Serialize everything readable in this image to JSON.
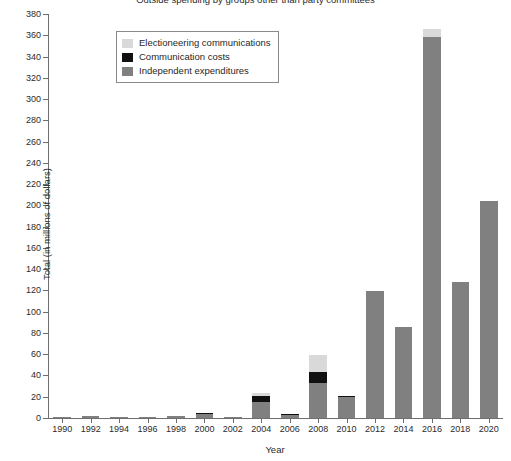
{
  "chart_data": {
    "type": "bar",
    "title": "Outside spending by groups other than party committees",
    "xlabel": "Year",
    "ylabel": "Total (in millions of dollars)",
    "ylim": [
      0,
      380
    ],
    "ytick_step": 20,
    "grid": false,
    "stacked": true,
    "legend_position": "top-left-inside",
    "categories": [
      "1990",
      "1992",
      "1994",
      "1996",
      "1998",
      "2000",
      "2002",
      "2004",
      "2006",
      "2008",
      "2010",
      "2012",
      "2014",
      "2016",
      "2018",
      "2020"
    ],
    "series": [
      {
        "name": "Independent expenditures",
        "color": "#808080",
        "values": [
          0.5,
          2,
          1,
          1,
          2,
          3.5,
          1,
          15,
          2.5,
          33,
          19.5,
          119,
          86,
          358,
          128,
          204
        ]
      },
      {
        "name": "Communication costs",
        "color": "#111111",
        "values": [
          0,
          0,
          0,
          0,
          0,
          0.5,
          0,
          6,
          0.5,
          10,
          0.5,
          0,
          0,
          0,
          0,
          0
        ]
      },
      {
        "name": "Electioneering communications",
        "color": "#d9d9d9",
        "values": [
          0,
          0,
          0,
          0,
          0,
          0,
          0,
          3,
          0,
          16,
          0,
          0,
          0,
          8,
          0,
          0
        ]
      }
    ],
    "totals": [
      0.5,
      2,
      1,
      1,
      2,
      4,
      1,
      24,
      3,
      59,
      20,
      119,
      86,
      366,
      128,
      204
    ],
    "yticks": [
      "0",
      "20",
      "40",
      "60",
      "80",
      "100",
      "120",
      "140",
      "160",
      "180",
      "200",
      "220",
      "240",
      "260",
      "280",
      "300",
      "320",
      "340",
      "360",
      "380"
    ]
  },
  "legend": {
    "items": [
      {
        "label": "Electioneering communications",
        "color": "#d9d9d9"
      },
      {
        "label": "Communication costs",
        "color": "#111111"
      },
      {
        "label": "Independent expenditures",
        "color": "#808080"
      }
    ]
  }
}
